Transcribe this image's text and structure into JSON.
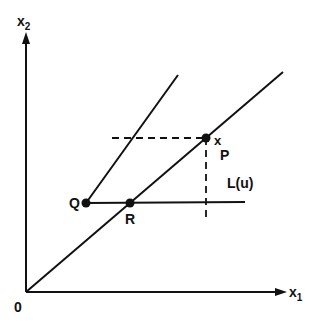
{
  "diagram": {
    "axes": {
      "x_label": "x",
      "x_sub": "1",
      "y_label": "x",
      "y_sub": "2",
      "origin_label": "0"
    },
    "points": {
      "P": "P",
      "P_marker": "x",
      "Q": "Q",
      "R": "R"
    },
    "annotation": "L(u)",
    "colors": {
      "ink": "#111111",
      "background": "#ffffff"
    }
  }
}
